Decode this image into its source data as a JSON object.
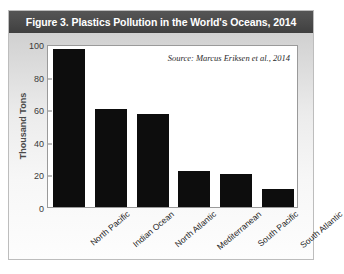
{
  "figure": {
    "title": "Figure 3. Plastics Pollution in the World's Oceans, 2014",
    "source_note": "Source: Marcus Eriksen et al., 2014",
    "title_band_color": "#4a4a4a",
    "bar_color": "#0d0d0d",
    "panel_background": "#ececec"
  },
  "chart_data": {
    "type": "bar",
    "title": "Figure 3. Plastics Pollution in the World's Oceans, 2014",
    "xlabel": "",
    "ylabel": "Thousand Tons",
    "categories": [
      "North Pacific",
      "Indian Ocean",
      "North Atlantic",
      "Mediterranean",
      "South Pacific",
      "South Atlantic"
    ],
    "values": [
      97,
      60,
      57,
      22,
      20,
      11
    ],
    "ylim": [
      0,
      100
    ],
    "yticks": [
      0,
      20,
      40,
      60,
      80,
      100
    ],
    "ytick_labels": [
      "0",
      "20",
      "40",
      "60",
      "80",
      "100"
    ],
    "grid": false,
    "legend": null,
    "annotations": [
      "Source: Marcus Eriksen et al., 2014"
    ],
    "series": [
      {
        "name": "Plastics pollution",
        "values": [
          97,
          60,
          57,
          22,
          20,
          11
        ]
      }
    ]
  }
}
